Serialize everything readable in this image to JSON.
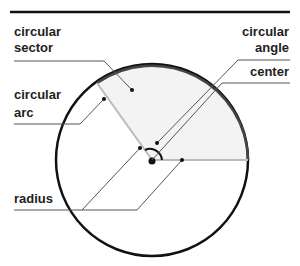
{
  "diagram": {
    "title_rule": true,
    "colors": {
      "circle": "#111111",
      "arc": "#444444",
      "sector_fill": "#f3f3f3",
      "radius_line": "#bbbbbb",
      "leader": "#555555",
      "text": "#222222"
    },
    "labels": {
      "sector_line1": "circular",
      "sector_line2": "sector",
      "arc_line1": "circular",
      "arc_line2": "arc",
      "angle_line1": "circular",
      "angle_line2": "angle",
      "center": "center",
      "radius": "radius"
    }
  }
}
